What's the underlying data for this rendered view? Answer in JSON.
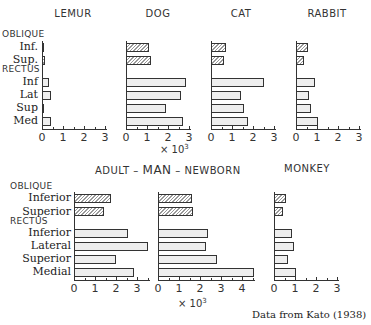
{
  "chart_data": [
    {
      "type": "bar",
      "orientation": "horizontal",
      "title": "LEMUR",
      "categories": [
        "Oblique Inf.",
        "Oblique Sup.",
        "Rectus Inf",
        "Rectus Lat",
        "Rectus Sup",
        "Rectus Med"
      ],
      "values": [
        0.05,
        0.15,
        0.35,
        0.45,
        0.05,
        0.45
      ],
      "xlim": [
        0,
        3
      ],
      "xticks": [
        0,
        1,
        2,
        3
      ],
      "xlabel": ""
    },
    {
      "type": "bar",
      "orientation": "horizontal",
      "title": "DOG",
      "categories": [
        "Oblique Inf.",
        "Oblique Sup.",
        "Rectus Inf",
        "Rectus Lat",
        "Rectus Sup",
        "Rectus Med"
      ],
      "values": [
        1.1,
        1.2,
        2.85,
        2.6,
        1.9,
        2.7
      ],
      "xlim": [
        0,
        3
      ],
      "xticks": [
        0,
        1,
        2,
        3
      ],
      "xlabel": "× 10³"
    },
    {
      "type": "bar",
      "orientation": "horizontal",
      "title": "CAT",
      "categories": [
        "Oblique Inf.",
        "Oblique Sup.",
        "Rectus Inf",
        "Rectus Lat",
        "Rectus Sup",
        "Rectus Med"
      ],
      "values": [
        0.7,
        0.6,
        2.5,
        1.45,
        1.55,
        1.75
      ],
      "xlim": [
        0,
        3
      ],
      "xticks": [
        0,
        1,
        2,
        3
      ],
      "xlabel": ""
    },
    {
      "type": "bar",
      "orientation": "horizontal",
      "title": "RABBIT",
      "categories": [
        "Oblique Inf.",
        "Oblique Sup.",
        "Rectus Inf",
        "Rectus Lat",
        "Rectus Sup",
        "Rectus Med"
      ],
      "values": [
        0.55,
        0.4,
        0.9,
        0.6,
        0.7,
        1.05
      ],
      "xlim": [
        0,
        3
      ],
      "xticks": [
        0,
        1,
        2,
        3
      ],
      "xlabel": ""
    },
    {
      "type": "bar",
      "orientation": "horizontal",
      "title": "ADULT MAN",
      "categories": [
        "Oblique Inferior",
        "Oblique Superior",
        "Rectus Inferior",
        "Rectus Lateral",
        "Rectus Superior",
        "Rectus Medial"
      ],
      "values": [
        1.75,
        1.45,
        2.55,
        3.5,
        2.0,
        2.85
      ],
      "xlim": [
        0,
        3.5
      ],
      "xticks": [
        0,
        1,
        2,
        3
      ],
      "xlabel": ""
    },
    {
      "type": "bar",
      "orientation": "horizontal",
      "title": "NEWBORN MAN",
      "categories": [
        "Oblique Inferior",
        "Oblique Superior",
        "Rectus Inferior",
        "Rectus Lateral",
        "Rectus Superior",
        "Rectus Medial"
      ],
      "values": [
        1.6,
        1.65,
        2.4,
        2.3,
        2.8,
        4.55
      ],
      "xlim": [
        0,
        4.5
      ],
      "xticks": [
        0,
        1,
        2,
        3,
        4
      ],
      "xlabel": "× 10³"
    },
    {
      "type": "bar",
      "orientation": "horizontal",
      "title": "MONKEY",
      "categories": [
        "Oblique Inferior",
        "Oblique Superior",
        "Rectus Inferior",
        "Rectus Lateral",
        "Rectus Superior",
        "Rectus Medial"
      ],
      "values": [
        0.55,
        0.45,
        0.85,
        0.95,
        0.65,
        1.05
      ],
      "xlim": [
        0,
        3
      ],
      "xticks": [
        0,
        1,
        2,
        3
      ],
      "xlabel": ""
    }
  ],
  "labels": {
    "top": {
      "group_oblique": "OBLIQUE",
      "group_rectus": "RECTUS",
      "rows": [
        "Inf.",
        "Sup.",
        "Inf",
        "Lat",
        "Sup",
        "Med"
      ]
    },
    "bottom": {
      "group_oblique": "OBLIQUE",
      "group_rectus": "RECTUS",
      "rows": [
        "Inferior",
        "Superior",
        "Inferior",
        "Lateral",
        "Superior",
        "Medial"
      ]
    },
    "titles": {
      "lemur": "LEMUR",
      "dog": "DOG",
      "cat": "CAT",
      "rabbit": "RABBIT",
      "adult": "ADULT",
      "dash1": "–",
      "man": "MAN",
      "dash2": "–",
      "newborn": "NEWBORN",
      "monkey": "MONKEY"
    },
    "multiplier_prefix": "× 10",
    "multiplier_exp": "3",
    "credit": "Data from Kato (1938)"
  }
}
